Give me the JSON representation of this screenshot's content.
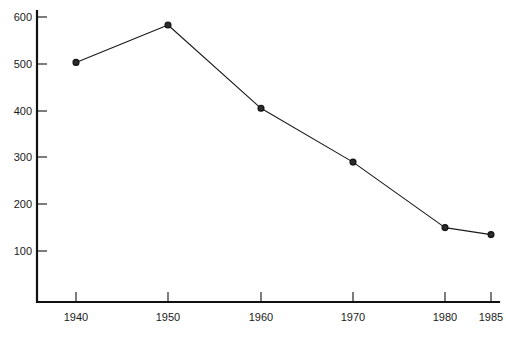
{
  "chart_data": {
    "type": "line",
    "title": "",
    "subtitle": "",
    "xlabel": "",
    "ylabel": "",
    "x": [
      1940,
      1950,
      1960,
      1970,
      1980,
      1985
    ],
    "values": [
      503,
      583,
      405,
      290,
      150,
      135
    ],
    "categories": [
      "1940",
      "1950",
      "1960",
      "1970",
      "1980",
      "1985"
    ],
    "x_tick_labels": [
      "1940",
      "1950",
      "1960",
      "1970",
      "1980",
      "1985"
    ],
    "y_tick_labels": [
      "100",
      "200",
      "300",
      "400",
      "500",
      "600"
    ],
    "y_ticks": [
      100,
      200,
      300,
      400,
      500,
      600
    ],
    "xlim": [
      1934,
      1988
    ],
    "ylim": [
      0,
      640
    ],
    "grid": false,
    "legend": null,
    "legend_position": "none",
    "marker": "circle",
    "line_color": "#1a1a1a",
    "marker_color": "#2b2b2b",
    "axis_color": "#111111",
    "background_color": "#ffffff",
    "annotations": []
  }
}
